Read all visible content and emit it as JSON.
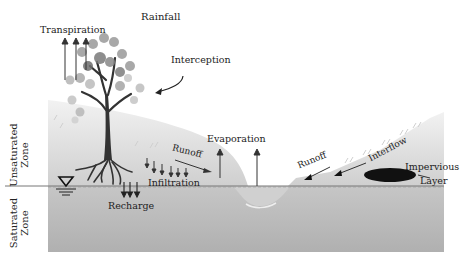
{
  "diagram": {
    "labels": {
      "rainfall": "Rainfall",
      "transpiration": "Transpiration",
      "interception": "Interception",
      "evaporation": "Evaporation",
      "runoff_left": "Runoff",
      "runoff_right": "Runoff",
      "interflow": "Interflow",
      "infiltration": "Infiltration",
      "recharge": "Recharge",
      "impervious_line1": "Impervious",
      "impervious_line2": "Layer",
      "unsaturated_line1": "Unsaturated",
      "unsaturated_line2": "Zone",
      "saturated_line1": "Saturated",
      "saturated_line2": "Zone"
    },
    "colors": {
      "ground_top": "#d8d8d8",
      "ground_bottom": "#b4b4b4",
      "saturated": "#bdbdbd",
      "water": "#c9c9c9",
      "tree": "#3a3a3a",
      "leaves": "#9a9a9a",
      "impervious": "#111111",
      "text": "#222222"
    }
  }
}
